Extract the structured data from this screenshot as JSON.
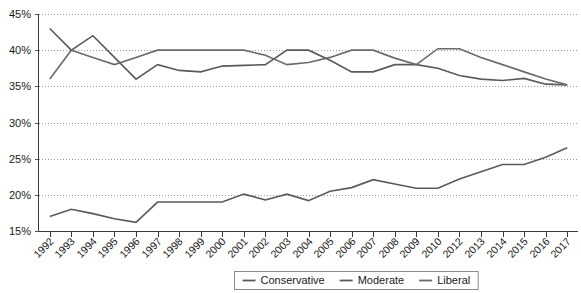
{
  "chart_data": {
    "type": "line",
    "title": "",
    "subtitle": "",
    "xlabel": "",
    "ylabel": "",
    "ylim": [
      15,
      45
    ],
    "ytick_values": [
      15,
      20,
      25,
      30,
      35,
      40,
      45
    ],
    "ytick_labels": [
      "15%",
      "20%",
      "25%",
      "30%",
      "35%",
      "40%",
      "45%"
    ],
    "grid": true,
    "grid_style": "dotted-horizontal",
    "legend_position": "bottom-center-right",
    "legend_border": true,
    "xtick_rotation": 45,
    "categories": [
      "1992",
      "1993",
      "1994",
      "1995",
      "1996",
      "1997",
      "1998",
      "1999",
      "2000",
      "2001",
      "2002",
      "2003",
      "2004",
      "2005",
      "2006",
      "2007",
      "2008",
      "2009",
      "2010",
      "2012",
      "2013",
      "2014",
      "2015",
      "2016",
      "2017"
    ],
    "series": [
      {
        "name": "Conservative",
        "color": "#5a5a5a",
        "values": [
          17.0,
          18.0,
          17.4,
          16.7,
          16.2,
          19.0,
          19.0,
          19.0,
          19.0,
          20.1,
          19.3,
          20.1,
          19.2,
          20.5,
          21.0,
          22.1,
          21.5,
          20.9,
          20.9,
          22.2,
          23.2,
          24.2,
          24.2,
          25.2,
          26.5
        ]
      },
      {
        "name": "Moderate",
        "color": "#5a5a5a",
        "values": [
          43.0,
          40.0,
          42.0,
          39.0,
          36.0,
          38.0,
          37.2,
          37.0,
          37.8,
          37.9,
          38.0,
          40.0,
          40.0,
          38.6,
          37.0,
          37.0,
          38.0,
          38.0,
          37.5,
          36.5,
          36.0,
          35.8,
          36.1,
          35.3,
          35.2
        ]
      },
      {
        "name": "Liberal",
        "color": "#6b6b6b",
        "values": [
          36.0,
          40.0,
          39.0,
          38.0,
          39.0,
          40.0,
          40.0,
          40.0,
          40.0,
          40.0,
          39.3,
          38.0,
          38.3,
          39.0,
          40.0,
          40.0,
          38.9,
          38.0,
          40.2,
          40.2,
          39.0,
          38.0,
          37.0,
          36.0,
          35.2
        ]
      }
    ]
  },
  "legend": {
    "items": [
      {
        "label": "Conservative"
      },
      {
        "label": "Moderate"
      },
      {
        "label": "Liberal"
      }
    ]
  },
  "colors": {
    "line_conservative": "#5a5a5a",
    "line_moderate": "#5a5a5a",
    "line_liberal": "#6b6b6b",
    "grid": "#9a9a9a",
    "axis": "#3a3a3a",
    "text": "#1a1a1a",
    "background": "#ffffff"
  }
}
